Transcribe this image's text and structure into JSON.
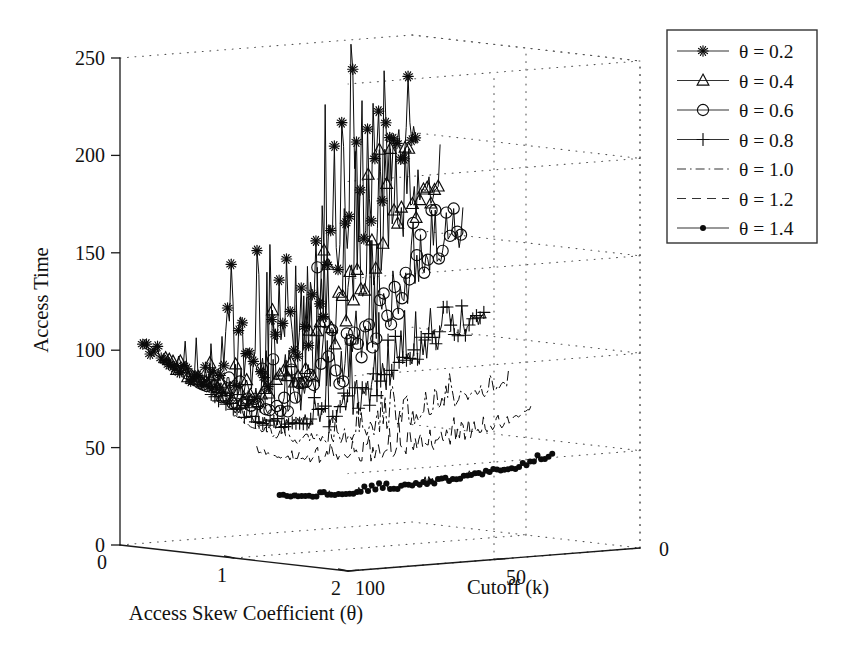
{
  "figure": {
    "width": 861,
    "height": 664,
    "background": "#ffffff",
    "ink_color": "#0b0b0b",
    "grid_color": "#555555"
  },
  "chart_data": {
    "type": "line",
    "projection": "3d-surface-lines",
    "title": "",
    "xlabel": "Access Skew Coefficient (θ)",
    "ylabel": "Access Time",
    "zlabel": "Cutoff (k)",
    "xlim": [
      0,
      2
    ],
    "xticks": [
      0,
      1,
      2
    ],
    "xticklabels": [
      "0",
      "1",
      "2"
    ],
    "ylim": [
      0,
      250
    ],
    "yticks": [
      0,
      50,
      100,
      150,
      200,
      250
    ],
    "yticklabels": [
      "0",
      "50",
      "100",
      "150",
      "200",
      "250"
    ],
    "zlim": [
      100,
      0
    ],
    "zticks": [
      100,
      50,
      0
    ],
    "zticklabels": [
      "100",
      "50",
      "0"
    ],
    "grid": true,
    "grid_style": "dotted",
    "legend_position": "upper-right-outside",
    "legend_entries": [
      {
        "label": "θ = 0.2",
        "marker": "asterisk",
        "linestyle": "solid"
      },
      {
        "label": "θ = 0.4",
        "marker": "triangle",
        "linestyle": "solid"
      },
      {
        "label": "θ = 0.6",
        "marker": "circle",
        "linestyle": "solid"
      },
      {
        "label": "θ = 0.8",
        "marker": "plus",
        "linestyle": "solid"
      },
      {
        "label": "θ = 1.0",
        "marker": "none",
        "linestyle": "dashdot"
      },
      {
        "label": "θ = 1.2",
        "marker": "none",
        "linestyle": "dashed"
      },
      {
        "label": "θ = 1.4",
        "marker": "dot",
        "linestyle": "solid"
      }
    ],
    "series": [
      {
        "name": "θ = 0.2",
        "theta": 0.2,
        "marker": "asterisk",
        "linestyle": "solid",
        "baseline": [
          105,
          100,
          96,
          93,
          90,
          88,
          86,
          85,
          84,
          83,
          82,
          82,
          83,
          84,
          86,
          88,
          91,
          95,
          99,
          104,
          110,
          117,
          124,
          131,
          139,
          147,
          155,
          163,
          171,
          178,
          184,
          189,
          193,
          196,
          198
        ],
        "noise_amp": [
          3,
          4,
          5,
          6,
          7,
          8,
          9,
          11,
          13,
          15,
          17,
          20,
          23,
          26,
          29,
          32,
          34,
          36,
          38,
          40,
          42,
          43,
          44,
          45,
          45,
          45,
          44,
          43,
          41,
          39,
          36,
          33,
          29,
          25,
          20
        ],
        "peak_max": 250,
        "seed": 17
      },
      {
        "name": "θ = 0.4",
        "theta": 0.4,
        "marker": "triangle",
        "linestyle": "solid",
        "baseline": [
          99,
          95,
          91,
          88,
          85,
          83,
          81,
          80,
          79,
          78,
          78,
          78,
          79,
          80,
          82,
          84,
          87,
          90,
          94,
          98,
          103,
          109,
          115,
          121,
          128,
          135,
          142,
          148,
          154,
          159,
          164,
          168,
          171,
          174,
          176
        ],
        "noise_amp": [
          2,
          3,
          4,
          5,
          6,
          7,
          8,
          9,
          11,
          13,
          15,
          17,
          19,
          21,
          24,
          26,
          28,
          30,
          32,
          33,
          34,
          35,
          36,
          36,
          36,
          35,
          34,
          33,
          31,
          29,
          27,
          24,
          21,
          18,
          15
        ],
        "peak_max": 197,
        "seed": 41
      },
      {
        "name": "θ = 0.6",
        "theta": 0.6,
        "marker": "circle",
        "linestyle": "solid",
        "baseline": [
          92,
          88,
          85,
          82,
          79,
          77,
          75,
          74,
          73,
          72,
          72,
          72,
          73,
          74,
          76,
          78,
          80,
          83,
          86,
          89,
          93,
          97,
          102,
          107,
          112,
          117,
          122,
          127,
          131,
          135,
          139,
          142,
          145,
          147,
          149
        ],
        "noise_amp": [
          2,
          2,
          3,
          4,
          5,
          6,
          7,
          8,
          9,
          11,
          12,
          14,
          15,
          17,
          18,
          20,
          21,
          22,
          23,
          24,
          25,
          26,
          26,
          26,
          26,
          25,
          25,
          24,
          23,
          21,
          20,
          18,
          16,
          14,
          12
        ],
        "peak_max": 166,
        "seed": 73
      },
      {
        "name": "θ = 0.8",
        "theta": 0.8,
        "marker": "plus",
        "linestyle": "solid",
        "baseline": [
          82,
          79,
          76,
          73,
          71,
          69,
          67,
          66,
          65,
          64,
          64,
          64,
          64,
          65,
          66,
          67,
          69,
          71,
          73,
          75,
          78,
          81,
          84,
          87,
          90,
          93,
          96,
          98,
          101,
          103,
          105,
          106,
          108,
          109,
          110
        ],
        "noise_amp": [
          1,
          2,
          2,
          3,
          4,
          4,
          5,
          6,
          7,
          8,
          9,
          10,
          11,
          12,
          13,
          14,
          15,
          15,
          16,
          16,
          17,
          17,
          17,
          17,
          17,
          16,
          16,
          15,
          14,
          13,
          12,
          11,
          10,
          9,
          8
        ],
        "peak_max": 118,
        "seed": 109
      },
      {
        "name": "θ = 1.0",
        "theta": 1.0,
        "marker": "none",
        "linestyle": "dashdot",
        "baseline": [
          73,
          70,
          67,
          65,
          63,
          61,
          60,
          59,
          58,
          57,
          57,
          57,
          57,
          57,
          58,
          58,
          59,
          60,
          61,
          62,
          63,
          64,
          65,
          67,
          68,
          69,
          70,
          71,
          72,
          73,
          74,
          75,
          76,
          77,
          78
        ],
        "noise_amp": [
          1,
          1,
          2,
          2,
          3,
          3,
          4,
          4,
          5,
          5,
          6,
          7,
          7,
          8,
          8,
          9,
          9,
          10,
          10,
          10,
          11,
          11,
          11,
          11,
          10,
          10,
          10,
          9,
          9,
          8,
          7,
          7,
          6,
          5,
          5
        ],
        "peak_max": 86,
        "seed": 211
      },
      {
        "name": "θ = 1.2",
        "theta": 1.2,
        "marker": "none",
        "linestyle": "dashed",
        "baseline": [
          56,
          54,
          53,
          52,
          51,
          50,
          50,
          49,
          49,
          49,
          49,
          49,
          49,
          49,
          49,
          50,
          50,
          50,
          51,
          51,
          52,
          52,
          53,
          53,
          54,
          54,
          55,
          56,
          57,
          58,
          59,
          61,
          63,
          65,
          67
        ],
        "noise_amp": [
          1,
          1,
          1,
          2,
          2,
          2,
          3,
          3,
          4,
          4,
          5,
          5,
          6,
          6,
          7,
          7,
          8,
          8,
          8,
          8,
          8,
          8,
          8,
          7,
          7,
          6,
          6,
          5,
          5,
          4,
          4,
          3,
          3,
          2,
          2
        ],
        "peak_max": 70,
        "seed": 307
      },
      {
        "name": "θ = 1.4",
        "theta": 1.4,
        "marker": "dot",
        "linestyle": "solid",
        "baseline": [
          35,
          34,
          34,
          33,
          33,
          33,
          33,
          33,
          33,
          33,
          33,
          33,
          34,
          34,
          34,
          34,
          35,
          35,
          35,
          35,
          36,
          36,
          36,
          37,
          37,
          37,
          38,
          38,
          39,
          39,
          40,
          41,
          42,
          43,
          45
        ],
        "noise_amp": [
          0.8,
          0.8,
          1,
          1,
          1,
          1.2,
          1.2,
          1.4,
          1.4,
          1.5,
          1.5,
          1.6,
          1.6,
          1.7,
          1.7,
          1.8,
          1.8,
          1.8,
          1.8,
          1.8,
          1.8,
          1.7,
          1.7,
          1.6,
          1.6,
          1.5,
          1.4,
          1.4,
          1.3,
          1.2,
          1.1,
          1,
          1,
          0.9,
          0.8
        ],
        "peak_max": 47,
        "seed": 401
      }
    ]
  }
}
